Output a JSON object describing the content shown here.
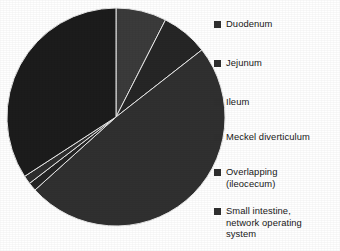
{
  "chart_data": {
    "type": "pie",
    "title": "",
    "subtitle": "",
    "xlabel": "",
    "ylabel": "",
    "grid": false,
    "legend_position": "right",
    "start_angle_deg": 0,
    "direction": "clockwise",
    "categories": [
      "Duodenum",
      "Jejunum",
      "Ileum",
      "Meckel diverticulum",
      "Overlapping (ileocecum)",
      "Small intestine, network operating system"
    ],
    "values": [
      7.5,
      7,
      49,
      1.2,
      1.3,
      34
    ],
    "units": "percent",
    "slices": [
      {
        "label": "Duodenum",
        "value": 7.5,
        "start_deg": 0,
        "end_deg": 27,
        "color": "#3b3b3b"
      },
      {
        "label": "Jejunum",
        "value": 7,
        "start_deg": 27,
        "end_deg": 52,
        "color": "#262626"
      },
      {
        "label": "Ileum",
        "value": 49,
        "start_deg": 52,
        "end_deg": 228,
        "color": "#303030"
      },
      {
        "label": "Meckel diverticulum",
        "value": 1.2,
        "start_deg": 228,
        "end_deg": 232.5,
        "color": "#242424"
      },
      {
        "label": "Overlapping (ileocecum)",
        "value": 1.3,
        "start_deg": 232.5,
        "end_deg": 237,
        "color": "#2e2e2e"
      },
      {
        "label": "Small intestine, network operating system",
        "value": 34,
        "start_deg": 237,
        "end_deg": 360,
        "color": "#1c1c1c"
      }
    ],
    "geometry": {
      "cx": 116,
      "cy": 117,
      "r": 109
    },
    "separator_color": "#e8e8e8",
    "background_color": "#ffffff"
  },
  "legend": {
    "marker_color": "#2f2f2f",
    "items": [
      {
        "label": "Duodenum",
        "top": 18
      },
      {
        "label": "Jejunum",
        "top": 57
      },
      {
        "label": "Ileum",
        "top": 96
      },
      {
        "label": "Meckel diverticulum",
        "top": 131
      },
      {
        "label": "Overlapping\n(ileocecum)",
        "top": 166
      },
      {
        "label": "Small intestine,\nnetwork operating\nsystem",
        "top": 205
      }
    ]
  }
}
